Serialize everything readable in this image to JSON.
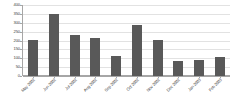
{
  "chart_data": {
    "type": "bar",
    "title": "",
    "subtitle": "",
    "xlabel": "",
    "ylabel": "",
    "categories": [
      "May 2002",
      "Jun 2002",
      "Jul 2002",
      "Aug 2002",
      "Sep 2002",
      "Oct 2002",
      "Nov 2002",
      "Dec 2002",
      "Jan 2003",
      "Feb 2003"
    ],
    "values": [
      205,
      350,
      230,
      212,
      112,
      288,
      202,
      85,
      90,
      105
    ],
    "ylim": [
      0,
      400
    ],
    "ytick_values": [
      0,
      50,
      100,
      150,
      200,
      250,
      300,
      350,
      400
    ],
    "ytick_labels": [
      "0",
      "50",
      "100",
      "150",
      "200",
      "250",
      "300",
      "350",
      "400"
    ],
    "grid": true,
    "legend": false,
    "legend_position": "none",
    "bar_color": "#595959",
    "gridline_color": "#e2e2e2",
    "axis_color": "#a6a6a6",
    "label_color": "#3f3f3f",
    "background_color": "#ffffff",
    "xtick_rotation": -45
  }
}
